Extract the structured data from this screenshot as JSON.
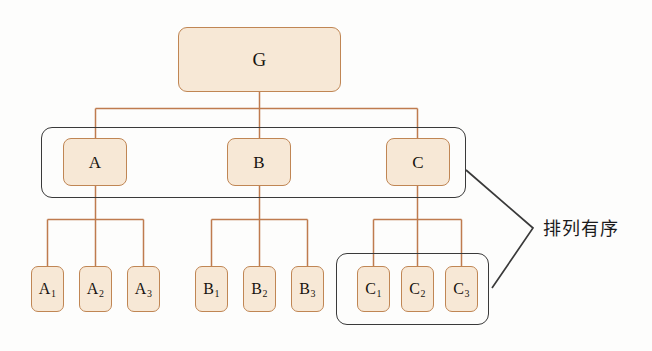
{
  "diagram": {
    "background_color": "#fdfdfc",
    "node_fill": "#f7e8d6",
    "node_border": "#c08654",
    "wire_color": "#bf7b4e",
    "group_border": "#3a3a3a",
    "annotation_text": "排列有序"
  },
  "nodes": {
    "root": {
      "label": "G"
    },
    "level1": [
      {
        "label": "A"
      },
      {
        "label": "B"
      },
      {
        "label": "C"
      }
    ],
    "level2": [
      {
        "base": "A",
        "sub": "1"
      },
      {
        "base": "A",
        "sub": "2"
      },
      {
        "base": "A",
        "sub": "3"
      },
      {
        "base": "B",
        "sub": "1"
      },
      {
        "base": "B",
        "sub": "2"
      },
      {
        "base": "B",
        "sub": "3"
      },
      {
        "base": "C",
        "sub": "1"
      },
      {
        "base": "C",
        "sub": "2"
      },
      {
        "base": "C",
        "sub": "3"
      }
    ]
  },
  "groups": [
    {
      "name": "level1-group",
      "note": "A B C enclosed"
    },
    {
      "name": "c-children-group",
      "note": "C1 C2 C3 enclosed"
    }
  ],
  "annotation": {
    "label": "排列有序"
  }
}
